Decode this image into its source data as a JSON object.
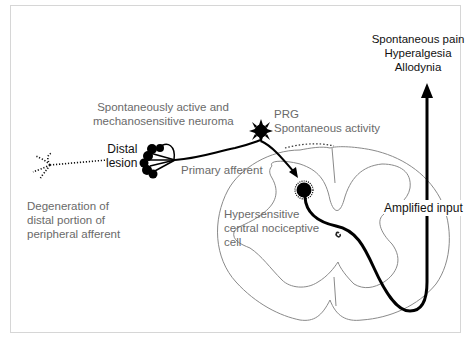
{
  "diagram": {
    "labels": {
      "neuroma": [
        "Spontaneously active and",
        "mechanosensitive neuroma"
      ],
      "distal_lesion": [
        "Distal",
        "lesion"
      ],
      "degeneration": [
        "Degeneration of",
        "distal portion of",
        "peripheral afferent"
      ],
      "primary_afferent": "Primary afferent",
      "prg": "PRG",
      "spontaneous_activity": "Spontaneous activity",
      "hypersensitive_cell": [
        "Hypersensitive",
        "central nociceptive",
        "cell"
      ],
      "amplified_input": "Amplified input",
      "outcomes": [
        "Spontaneous pain",
        "Hyperalgesia",
        "Allodynia"
      ]
    },
    "colors": {
      "stroke_main": "#000000",
      "stroke_outline": "#8a8a8a",
      "text_gray": "#6a6a6a",
      "text_dark": "#111111",
      "frame_border": "#d6d6d6"
    }
  }
}
